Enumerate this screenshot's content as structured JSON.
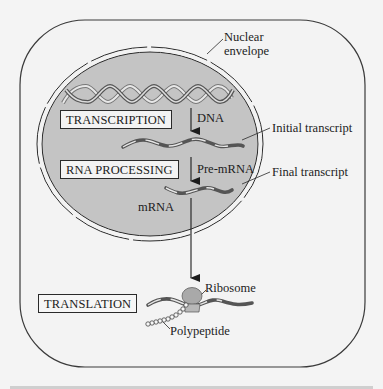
{
  "diagram": {
    "type": "eukaryotic gene expression (central dogma)",
    "colors": {
      "background": "#f4f4f4",
      "nucleus_fill": "#c4c4c4",
      "stroke": "#2a2a2a",
      "ribosome": "#a9a9a9"
    },
    "stages": [
      {
        "id": "transcription",
        "label": "TRANSCRIPTION"
      },
      {
        "id": "rna_processing",
        "label": "RNA PROCESSING"
      },
      {
        "id": "translation",
        "label": "TRANSLATION"
      }
    ],
    "molecule_labels": {
      "dna": "DNA",
      "pre_mrna": "Pre-mRNA",
      "mrna": "mRNA"
    },
    "callouts": {
      "nuclear_envelope_line1": "Nuclear",
      "nuclear_envelope_line2": "envelope",
      "initial_transcript": "Initial transcript",
      "final_transcript": "Final transcript",
      "ribosome": "Ribosome",
      "polypeptide": "Polypeptide"
    },
    "flow": [
      "DNA",
      "Pre-mRNA",
      "mRNA",
      "Ribosome",
      "Polypeptide"
    ]
  }
}
